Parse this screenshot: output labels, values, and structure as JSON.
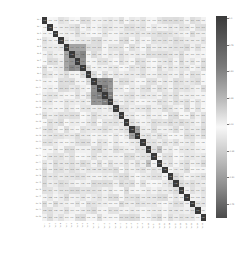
{
  "chart_data": {
    "type": "heatmap",
    "title": "",
    "xlabel": "",
    "ylabel": "",
    "n_variables": 30,
    "labels": [
      "Var 1",
      "Var 2",
      "Var 3",
      "Var 4",
      "Var 5",
      "Var 6",
      "Var 7",
      "Var 8",
      "Var 9",
      "Var 10",
      "Var 11",
      "Var 12",
      "Var 13",
      "Var 14",
      "Var 15",
      "Var 16",
      "Var 17",
      "Var 18",
      "Var 19",
      "Var 20",
      "Var 21",
      "Var 22",
      "Var 23",
      "Var 24",
      "Var 25",
      "Var 26",
      "Var 27",
      "Var 28",
      "Var 29",
      "Var 30"
    ],
    "label_note": "axis labels rendered but illegible at this resolution",
    "value_range": [
      -1.0,
      1.0
    ],
    "colormap": "diverging gray (dark at both extremes, white near 0)",
    "colorbar_ticks": [
      "1.0",
      "0.75",
      "0.50",
      "0.25",
      "0.00",
      "-0.25",
      "-0.50",
      "-0.75"
    ],
    "strong_blocks": [
      {
        "vars": [
          5,
          6,
          7,
          8
        ],
        "approx_corr": 0.6
      },
      {
        "vars": [
          10,
          11,
          12,
          13
        ],
        "approx_corr": 0.7
      },
      {
        "vars": [
          17,
          18
        ],
        "approx_corr": 0.5
      },
      {
        "vars": [
          20,
          22
        ],
        "approx_corr": 0.4
      }
    ],
    "diagonal": 1.0,
    "annotated": true
  }
}
